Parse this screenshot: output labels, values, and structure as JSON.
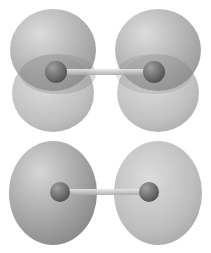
{
  "figure": {
    "panels": [
      {
        "name": "pi-orbital",
        "nuclei": [
          {
            "cx": 58,
            "cy": 72
          },
          {
            "cx": 154,
            "cy": 72
          }
        ],
        "bond": {
          "x1": 58,
          "x2": 154,
          "y": 72
        },
        "lobes": [
          {
            "cx": 53,
            "cy": 50,
            "rx": 44,
            "ry": 42
          },
          {
            "cx": 158,
            "cy": 50,
            "rx": 44,
            "ry": 42
          },
          {
            "cx": 53,
            "cy": 92,
            "rx": 42,
            "ry": 40
          },
          {
            "cx": 158,
            "cy": 92,
            "rx": 42,
            "ry": 40
          }
        ]
      },
      {
        "name": "sigma-orbital",
        "nuclei": [
          {
            "cx": 60,
            "cy": 192
          },
          {
            "cx": 149,
            "cy": 192
          }
        ],
        "bond": {
          "x1": 60,
          "x2": 149,
          "y": 192
        },
        "lobes": [
          {
            "cx": 55,
            "cy": 193,
            "rx": 45,
            "ry": 52
          },
          {
            "cx": 157,
            "cy": 193,
            "rx": 45,
            "ry": 52
          }
        ]
      }
    ],
    "colors": {
      "lobe_dark": "#8a8a8a",
      "lobe_light": "#c4c4c4",
      "nucleus": "#6e6e6e",
      "bond": "#d0d0d0"
    }
  }
}
